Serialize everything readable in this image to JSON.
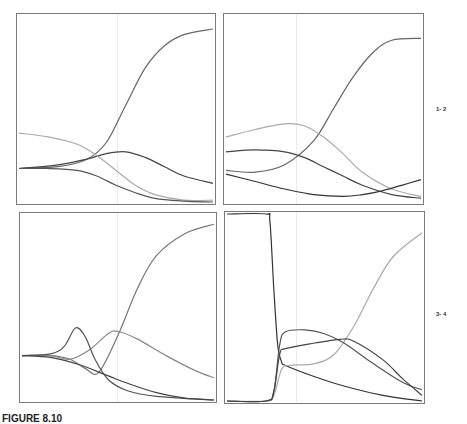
{
  "figure": {
    "row_labels": [
      "1- 2",
      "3- 4"
    ],
    "caption": "FIGURE 8.10"
  },
  "chart_data": [
    {
      "type": "line",
      "panel": 1,
      "title": "",
      "xlabel": "",
      "ylabel": "",
      "xlim": [
        0,
        1
      ],
      "ylim": [
        0,
        1
      ],
      "grid": false,
      "series": [
        {
          "name": "rising",
          "color": "#666666",
          "x": [
            0,
            0.2,
            0.35,
            0.45,
            0.55,
            0.65,
            0.75,
            0.85,
            1.0
          ],
          "y": [
            0.18,
            0.19,
            0.23,
            0.32,
            0.52,
            0.72,
            0.84,
            0.9,
            0.93
          ]
        },
        {
          "name": "hump",
          "color": "#444444",
          "x": [
            0,
            0.2,
            0.35,
            0.45,
            0.55,
            0.65,
            0.75,
            0.85,
            1.0
          ],
          "y": [
            0.18,
            0.2,
            0.23,
            0.26,
            0.27,
            0.24,
            0.19,
            0.14,
            0.1
          ]
        },
        {
          "name": "falling-light",
          "color": "#aaaaaa",
          "x": [
            0,
            0.15,
            0.3,
            0.4,
            0.5,
            0.6,
            0.7,
            0.85,
            1.0
          ],
          "y": [
            0.37,
            0.35,
            0.31,
            0.25,
            0.17,
            0.09,
            0.04,
            0.01,
            0.01
          ]
        },
        {
          "name": "falling-dark",
          "color": "#555555",
          "x": [
            0,
            0.15,
            0.3,
            0.4,
            0.5,
            0.6,
            0.7,
            0.85,
            1.0
          ],
          "y": [
            0.18,
            0.18,
            0.17,
            0.14,
            0.09,
            0.05,
            0.02,
            0.005,
            0.0
          ]
        }
      ]
    },
    {
      "type": "line",
      "panel": 2,
      "title": "",
      "xlabel": "",
      "ylabel": "",
      "xlim": [
        0,
        1
      ],
      "ylim": [
        0,
        1
      ],
      "grid": false,
      "series": [
        {
          "name": "rising",
          "color": "#666666",
          "x": [
            0,
            0.15,
            0.3,
            0.45,
            0.55,
            0.65,
            0.75,
            0.85,
            1.0
          ],
          "y": [
            0.17,
            0.16,
            0.2,
            0.33,
            0.5,
            0.67,
            0.8,
            0.87,
            0.88
          ]
        },
        {
          "name": "hump-light",
          "color": "#aaaaaa",
          "x": [
            0,
            0.15,
            0.3,
            0.4,
            0.5,
            0.6,
            0.7,
            0.85,
            1.0
          ],
          "y": [
            0.35,
            0.39,
            0.42,
            0.41,
            0.35,
            0.26,
            0.16,
            0.07,
            0.03
          ]
        },
        {
          "name": "middle",
          "color": "#444444",
          "x": [
            0,
            0.15,
            0.3,
            0.4,
            0.5,
            0.6,
            0.7,
            0.85,
            1.0
          ],
          "y": [
            0.27,
            0.28,
            0.27,
            0.24,
            0.19,
            0.14,
            0.09,
            0.04,
            0.02
          ]
        },
        {
          "name": "dip",
          "color": "#333333",
          "x": [
            0,
            0.15,
            0.3,
            0.45,
            0.6,
            0.7,
            0.8,
            0.9,
            1.0
          ],
          "y": [
            0.15,
            0.11,
            0.07,
            0.04,
            0.03,
            0.04,
            0.06,
            0.09,
            0.12
          ]
        }
      ]
    },
    {
      "type": "line",
      "panel": 3,
      "title": "",
      "xlabel": "",
      "ylabel": "",
      "xlim": [
        0,
        1
      ],
      "ylim": [
        0,
        1
      ],
      "grid": false,
      "series": [
        {
          "name": "rising",
          "color": "#777777",
          "x": [
            0,
            0.15,
            0.25,
            0.33,
            0.4,
            0.5,
            0.6,
            0.7,
            0.85,
            1.0
          ],
          "y": [
            0.24,
            0.24,
            0.22,
            0.17,
            0.15,
            0.35,
            0.6,
            0.78,
            0.9,
            0.95
          ]
        },
        {
          "name": "broad-hump",
          "color": "#888888",
          "x": [
            0,
            0.15,
            0.25,
            0.35,
            0.45,
            0.5,
            0.6,
            0.75,
            0.9,
            1.0
          ],
          "y": [
            0.24,
            0.24,
            0.22,
            0.27,
            0.36,
            0.37,
            0.33,
            0.24,
            0.16,
            0.12
          ]
        },
        {
          "name": "sharp-peak",
          "color": "#555555",
          "x": [
            0,
            0.15,
            0.22,
            0.28,
            0.33,
            0.38,
            0.45,
            0.55,
            0.7,
            1.0
          ],
          "y": [
            0.24,
            0.25,
            0.29,
            0.39,
            0.34,
            0.22,
            0.11,
            0.05,
            0.02,
            0.0
          ]
        },
        {
          "name": "falling",
          "color": "#444444",
          "x": [
            0,
            0.15,
            0.3,
            0.45,
            0.55,
            0.7,
            0.85,
            1.0
          ],
          "y": [
            0.24,
            0.23,
            0.19,
            0.13,
            0.09,
            0.04,
            0.01,
            0.0
          ]
        }
      ]
    },
    {
      "type": "line",
      "panel": 4,
      "title": "",
      "xlabel": "",
      "ylabel": "",
      "xlim": [
        0,
        1
      ],
      "ylim": [
        0,
        1
      ],
      "grid": false,
      "series": [
        {
          "name": "step-down",
          "color": "#333333",
          "x": [
            0,
            0.2,
            0.22,
            0.24,
            0.26,
            0.28,
            0.3,
            0.45,
            0.6,
            0.8,
            1.0
          ],
          "y": [
            1.0,
            1.0,
            0.96,
            0.6,
            0.3,
            0.21,
            0.19,
            0.13,
            0.08,
            0.03,
            0.0
          ]
        },
        {
          "name": "rising-light",
          "color": "#aaaaaa",
          "x": [
            0,
            0.2,
            0.24,
            0.28,
            0.32,
            0.45,
            0.55,
            0.65,
            0.75,
            0.85,
            1.0
          ],
          "y": [
            0.0,
            0.0,
            0.03,
            0.17,
            0.19,
            0.2,
            0.25,
            0.4,
            0.6,
            0.77,
            0.9
          ]
        },
        {
          "name": "hump-upper",
          "color": "#555555",
          "x": [
            0,
            0.2,
            0.24,
            0.27,
            0.3,
            0.4,
            0.5,
            0.6,
            0.75,
            0.9,
            1.0
          ],
          "y": [
            0.0,
            0.0,
            0.05,
            0.3,
            0.37,
            0.38,
            0.36,
            0.31,
            0.2,
            0.1,
            0.06
          ]
        },
        {
          "name": "hump-lower",
          "color": "#444444",
          "x": [
            0,
            0.2,
            0.24,
            0.27,
            0.3,
            0.45,
            0.58,
            0.65,
            0.8,
            0.9,
            1.0
          ],
          "y": [
            0.0,
            0.0,
            0.05,
            0.25,
            0.28,
            0.31,
            0.33,
            0.32,
            0.22,
            0.12,
            0.03
          ]
        }
      ]
    }
  ]
}
